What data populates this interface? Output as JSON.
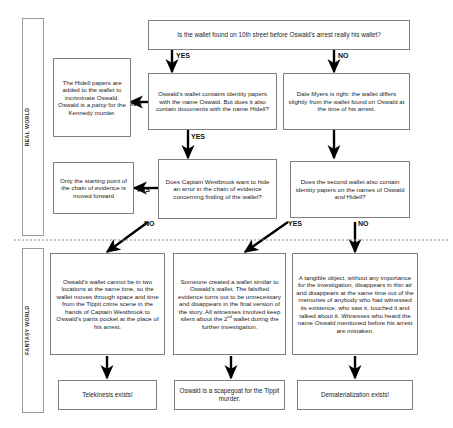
{
  "lanes": [
    {
      "id": "real-world",
      "label": "REAL WORLD"
    },
    {
      "id": "fantasy-world",
      "label": "FANTASY WORLD"
    }
  ],
  "nodes": {
    "q_root": "Is the wallet found on 10th street before Oswald's arrest really his wallet?",
    "hidell_papers": "The Hidell papers are added to the wallet to incriminate Oswald. Oswald is a patsy for the Kennedy murder.",
    "hidell_papers_plain": "The Hidell papers are added to the wallet to incriminate Oswald. Oswald is a ",
    "hidell_papers_italic": "patsy",
    "hidell_papers_tail": " for the Kennedy murder.",
    "q_oswald_wallet": "Oswald's wallet contains identity papers with the name Oswald. But does it also contain documents with the name Hidell?",
    "dale_myers": "Dale Myers is right: the wallet differs slightly from the wallet found on Oswald at the time of his arrest.",
    "starting_point": "Only the starting point of the chain of evidence is moved forward",
    "q_westbrook": "Does Captain Westbrook want to hide an error in the chain of evidence concerning finding of the wallet?",
    "q_second_wallet_lead": "Does the second wallet also contain identity papers on the names of Oswald ",
    "q_second_wallet_italic": "and",
    "q_second_wallet_tail": " Hidell?",
    "fantasy_two_locations": "Oswald's wallet cannot be in two locations at the same time, so the wallet moves through space and time from the Tippit crime scene in the hands of Captain Westbrook to Oswald's pants pocket at the place of his arrest.",
    "fantasy_created_wallet_a": "Someone created a wallet similar to Oswald's wallet. The falsified evidence  turns out to be unnecessary and disappears in the final version of the story. All witnesses involved keep silent about the ",
    "fantasy_created_wallet_sup": "2",
    "fantasy_created_wallet_supsup": "nd",
    "fantasy_created_wallet_b": " wallet during the further investigation.",
    "fantasy_tangible": "A tangible object, without any importance for the investigation, disappears in thin air and disappears at the same time out of the memories of anybody who had witnessed its existence, who saw it, touched it and talked about it. Witnesses who heard the name Oswald mentioned before his arrest are mistaken.",
    "concl_telekinesis": "Telekinesis exists!",
    "concl_scapegoat": "Oswald is a scapegoat for the Tippit murder.",
    "concl_dematerialization": "Dematerialization exists!"
  },
  "edges": {
    "root_yes": "YES",
    "root_no": "NO",
    "oswald_wallet_no": "NO",
    "oswald_wallet_yes": "YES",
    "westbrook_yes": "YES",
    "westbrook_no": "NO",
    "second_wallet_yes": "YES",
    "second_wallet_no": "NO"
  },
  "colors": {
    "box_border": "#808080",
    "lane_border": "#9a9a9a",
    "arrow": "#000000",
    "divider": "#8c8c8c",
    "text": "#1c1c1c",
    "background": "#ffffff"
  }
}
